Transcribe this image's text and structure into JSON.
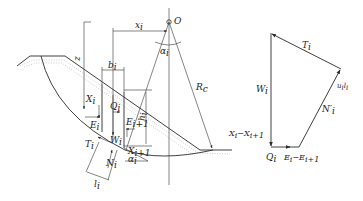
{
  "figure": {
    "colors": {
      "line": "#2a2a2a",
      "text": "#222222",
      "soil_hatch": "#9a9a9a",
      "background": "#ffffff"
    }
  },
  "slope_diagram": {
    "center_label": "O",
    "labels": {
      "x_i": "x",
      "x_i_sub": "i",
      "alpha_top": "α",
      "alpha_top_sub": "i",
      "z": "z",
      "b_i": "b",
      "b_i_sub": "i",
      "R_c": "R",
      "R_c_sub": "c",
      "X_i": "X",
      "X_i_sub": "i",
      "Q_i": "Q",
      "Q_i_sub": "i",
      "h_i": "h",
      "h_i_sub": "i",
      "E_i": "E",
      "E_i_sub": "i",
      "E_i1": "E",
      "E_i1_sub": "i+1",
      "W_i": "W",
      "W_i_sub": "i",
      "T_i": "T",
      "T_i_sub": "i",
      "X_i1": "X",
      "X_i1_sub": "i+1",
      "N_i": "N",
      "N_i_sub": "i",
      "alpha_bottom": "α",
      "alpha_bottom_sub": "i",
      "l_i": "l",
      "l_i_sub": "i"
    }
  },
  "force_polygon": {
    "labels": {
      "T_i": "T",
      "T_i_sub": "i",
      "u_i_l_i": "u",
      "u_i_l_i_sub1": "i",
      "u_i_l_i_mid": "l",
      "u_i_l_i_sub2": "i",
      "W_i": "W",
      "W_i_sub": "i",
      "N_prime_i": "N′",
      "N_prime_i_sub": "i",
      "X_diff": "X",
      "X_diff_sub1": "i",
      "X_diff_mid": "−X",
      "X_diff_sub2": "i+1",
      "Q_i": "Q",
      "Q_i_sub": "i",
      "E_diff": "E",
      "E_diff_sub1": "i",
      "E_diff_mid": "−E",
      "E_diff_sub2": "i+1"
    }
  }
}
